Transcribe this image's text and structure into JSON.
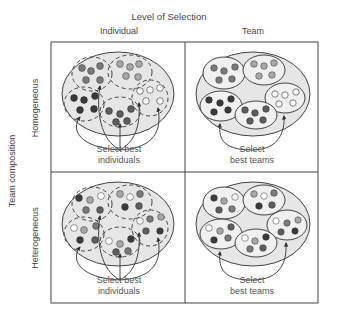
{
  "diagram": {
    "title": "Level of Selection",
    "columns": [
      "Individual",
      "Team"
    ],
    "row_axis_label": "Team composition",
    "rows": [
      "Homogeneous",
      "Heterogeneous"
    ],
    "cells": [
      {
        "row": "Homogeneous",
        "col": "Individual",
        "caption_line1": "Select best",
        "caption_line2": "individuals"
      },
      {
        "row": "Homogeneous",
        "col": "Team",
        "caption_line1": "Select",
        "caption_line2": "best teams"
      },
      {
        "row": "Heterogeneous",
        "col": "Individual",
        "caption_line1": "Select best",
        "caption_line2": "individuals"
      },
      {
        "row": "Heterogeneous",
        "col": "Team",
        "caption_line1": "Select",
        "caption_line2": "best teams"
      }
    ],
    "colors": {
      "dark": "#3a3a3a",
      "medium": "#7a7a7a",
      "light": "#a8a8a8",
      "white": "#ffffff",
      "population_fill": "#e6e6e6",
      "line": "#444444"
    }
  }
}
